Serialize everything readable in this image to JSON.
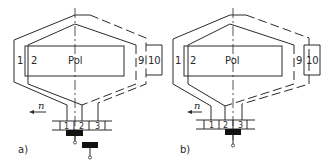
{
  "diagrams": [
    {
      "id": "a",
      "caption": "a)",
      "pole_label": "Pol",
      "coil_labels": [
        "1",
        "2",
        "9",
        "10"
      ],
      "commutator_segments": [
        "1",
        "2",
        "3"
      ],
      "rotation_label": "n",
      "brushes": 2
    },
    {
      "id": "b",
      "caption": "b)",
      "pole_label": "Pol",
      "coil_labels": [
        "1",
        "2",
        "9",
        "10"
      ],
      "commutator_segments": [
        "1",
        "2",
        "3"
      ],
      "rotation_label": "n",
      "brushes": 1
    }
  ]
}
